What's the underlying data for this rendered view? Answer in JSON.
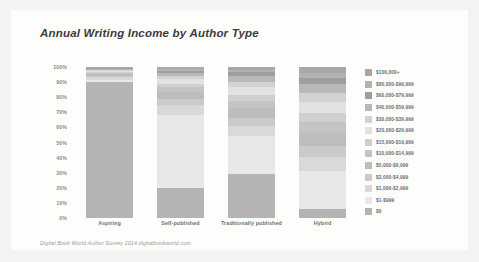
{
  "card": {
    "title": "Annual Writing Income by Author Type",
    "footer": "Digital Book World Author Survey 2014 digitalbookworld.com",
    "background": "#fdfdfc",
    "page_background": "#f3f3f1"
  },
  "chart_data": {
    "type": "bar",
    "stacked": true,
    "orientation": "vertical",
    "title": "Annual Writing Income by Author Type",
    "xlabel": "",
    "ylabel": "",
    "ylim": [
      0,
      100
    ],
    "yunit": "%",
    "grid": false,
    "legend_position": "right",
    "categories": [
      "Aspiring",
      "Self-published",
      "Traditionally published",
      "Hybrid"
    ],
    "ytick_labels": [
      "100%",
      "90%",
      "80%",
      "70%",
      "60%",
      "50%",
      "40%",
      "30%",
      "20%",
      "10%",
      "0%"
    ],
    "ytick_values": [
      100,
      90,
      80,
      70,
      60,
      50,
      40,
      30,
      20,
      10,
      0
    ],
    "series": [
      {
        "name": "$100,000+",
        "color": "#a8a8a8",
        "values": [
          0.5,
          1.5,
          2.0,
          4.0
        ]
      },
      {
        "name": "$80,000-$99,999",
        "color": "#b2b2b2",
        "values": [
          0.4,
          1.0,
          1.5,
          3.0
        ]
      },
      {
        "name": "$60,000-$79,999",
        "color": "#9e9e9e",
        "values": [
          0.5,
          1.5,
          2.5,
          4.5
        ]
      },
      {
        "name": "$40,000-$59,999",
        "color": "#b8b8b8",
        "values": [
          0.6,
          2.0,
          4.0,
          6.0
        ]
      },
      {
        "name": "$30,000-$39,999",
        "color": "#d2d2d2",
        "values": [
          0.6,
          2.0,
          3.5,
          5.5
        ]
      },
      {
        "name": "$20,000-$29,999",
        "color": "#e2e2e2",
        "values": [
          0.8,
          3.0,
          5.0,
          7.5
        ]
      },
      {
        "name": "$15,000-$19,999",
        "color": "#cfcfcf",
        "values": [
          0.6,
          2.5,
          4.0,
          6.0
        ]
      },
      {
        "name": "$10,000-$14,999",
        "color": "#c4c4c4",
        "values": [
          0.8,
          3.0,
          5.0,
          7.0
        ]
      },
      {
        "name": "$5,000-$9,999",
        "color": "#bdbdbd",
        "values": [
          1.2,
          4.5,
          6.5,
          9.0
        ]
      },
      {
        "name": "$3,000-$4,999",
        "color": "#cacaca",
        "values": [
          1.0,
          4.0,
          5.0,
          7.0
        ]
      },
      {
        "name": "$1,000-$2,999",
        "color": "#d9d9d9",
        "values": [
          1.5,
          7.0,
          7.0,
          9.5
        ]
      },
      {
        "name": "$1-$999",
        "color": "#e8e8e8",
        "values": [
          1.5,
          48.0,
          25.0,
          25.0
        ]
      },
      {
        "name": "$0",
        "color": "#b4b4b4",
        "values": [
          90.0,
          20.0,
          29.0,
          6.0
        ]
      }
    ]
  }
}
